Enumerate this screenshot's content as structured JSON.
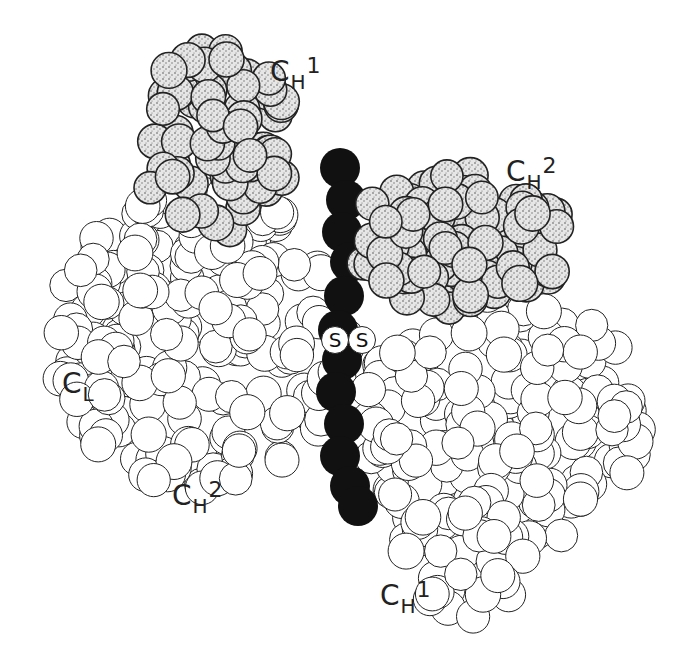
{
  "figure": {
    "type": "space-filling molecular model",
    "background": "#ffffff",
    "colors": {
      "chain": "#111111",
      "stippled_fill": "#d9d9d9",
      "open_fill": "#ffffff",
      "outline": "#222222"
    }
  },
  "labels": [
    {
      "id": "ch1-top",
      "main": "C",
      "sub": "H",
      "sup": "1",
      "x": 270,
      "y": 58
    },
    {
      "id": "ch2-top",
      "main": "C",
      "sub": "H",
      "sup": "2",
      "x": 506,
      "y": 158
    },
    {
      "id": "cl",
      "main": "C",
      "sub": "L",
      "sup": "",
      "x": 62,
      "y": 370
    },
    {
      "id": "ch2-bottom",
      "main": "C",
      "sub": "H",
      "sup": "2",
      "x": 172,
      "y": 482
    },
    {
      "id": "ch1-bottom",
      "main": "C",
      "sub": "H",
      "sup": "1",
      "x": 380,
      "y": 582
    }
  ],
  "disulfide": {
    "left": "S",
    "right": "S",
    "left_pos": {
      "x": 321,
      "y": 326
    },
    "right_pos": {
      "x": 348,
      "y": 326
    }
  },
  "clusters": [
    {
      "id": "ch1-upper-left",
      "style": "stippled",
      "cx": 215,
      "cy": 140,
      "rx": 75,
      "ry": 95,
      "r": 17,
      "n": 70,
      "seed": 3
    },
    {
      "id": "ch2-upper-right",
      "style": "stippled",
      "cx": 460,
      "cy": 240,
      "rx": 105,
      "ry": 70,
      "r": 17,
      "n": 95,
      "seed": 7
    },
    {
      "id": "cl-left",
      "style": "open",
      "cx": 200,
      "cy": 340,
      "rx": 150,
      "ry": 150,
      "r": 17,
      "n": 210,
      "seed": 11
    },
    {
      "id": "ch1-lower-right",
      "style": "open",
      "cx": 500,
      "cy": 420,
      "rx": 140,
      "ry": 130,
      "r": 17,
      "n": 190,
      "seed": 19
    },
    {
      "id": "ch1-tail",
      "style": "open",
      "cx": 470,
      "cy": 560,
      "rx": 70,
      "ry": 60,
      "r": 17,
      "n": 40,
      "seed": 23
    }
  ],
  "chain": [
    {
      "x": 340,
      "y": 168
    },
    {
      "x": 346,
      "y": 200
    },
    {
      "x": 342,
      "y": 232
    },
    {
      "x": 350,
      "y": 262
    },
    {
      "x": 344,
      "y": 296
    },
    {
      "x": 338,
      "y": 330
    },
    {
      "x": 342,
      "y": 360
    },
    {
      "x": 336,
      "y": 392
    },
    {
      "x": 344,
      "y": 424
    },
    {
      "x": 340,
      "y": 456
    },
    {
      "x": 350,
      "y": 486
    },
    {
      "x": 358,
      "y": 506
    }
  ]
}
